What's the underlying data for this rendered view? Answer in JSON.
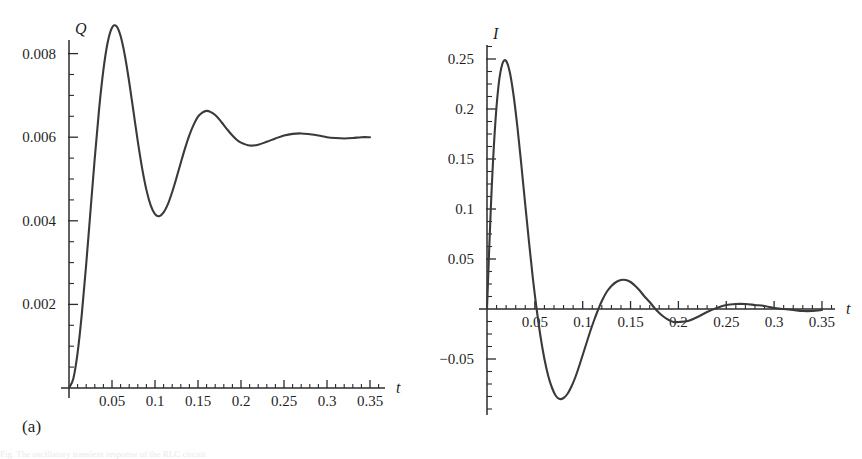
{
  "figure": {
    "panels": [
      {
        "caption": "(a)",
        "y_axis_name": "Q",
        "x_axis_name": "t"
      },
      {
        "caption": "(b)",
        "y_axis_name": "I",
        "x_axis_name": "t"
      }
    ],
    "cut_off_caption_line": "Fig. The oscillatory transient response of the RLC circuit"
  },
  "chart_data": [
    {
      "type": "line",
      "title": "",
      "subtitle": "",
      "panel_label": "(a)",
      "xlabel": "t",
      "ylabel": "Q",
      "xlim": [
        0,
        0.36
      ],
      "ylim": [
        0,
        0.0085
      ],
      "grid": false,
      "legend": "none",
      "xticks": [
        0.05,
        0.1,
        0.15,
        0.2,
        0.25,
        0.3,
        0.35
      ],
      "xtick_labels": [
        "0.05",
        "0.1",
        "0.15",
        "0.2",
        "0.25",
        "0.3",
        "0.35"
      ],
      "xtick_minor_step": 0.01,
      "yticks": [
        0.002,
        0.004,
        0.006,
        0.008
      ],
      "ytick_labels": [
        "0.002",
        "0.004",
        "0.006",
        "0.008"
      ],
      "ytick_minor_step": 0.0005,
      "annotations": [
        {
          "label": "first maximum",
          "x": 0.054,
          "y": 0.0081
        },
        {
          "label": "first minimum",
          "x": 0.107,
          "y": 0.00528
        },
        {
          "label": "second maximum",
          "x": 0.158,
          "y": 0.00625
        },
        {
          "label": "second minimum",
          "x": 0.209,
          "y": 0.00585
        },
        {
          "label": "steady state",
          "x": 0.35,
          "y": 0.006
        }
      ],
      "model": {
        "description": "Q(t) = Qf * (1 - exp(-alpha*t) * (cos(w*t) + (alpha/w)*sin(w*t)))",
        "Qf": 0.006,
        "alpha": 27.0,
        "w": 60.5
      },
      "series": [
        {
          "name": "Q(t)",
          "color": "#3a3a3a",
          "x": [
            0,
            0.005,
            0.01,
            0.015,
            0.02,
            0.025,
            0.03,
            0.035,
            0.04,
            0.045,
            0.05,
            0.055,
            0.06,
            0.065,
            0.07,
            0.075,
            0.08,
            0.085,
            0.09,
            0.095,
            0.1,
            0.105,
            0.11,
            0.115,
            0.12,
            0.125,
            0.13,
            0.135,
            0.14,
            0.145,
            0.15,
            0.155,
            0.16,
            0.165,
            0.17,
            0.175,
            0.18,
            0.185,
            0.19,
            0.195,
            0.2,
            0.21,
            0.22,
            0.23,
            0.24,
            0.25,
            0.26,
            0.27,
            0.28,
            0.29,
            0.3,
            0.31,
            0.32,
            0.33,
            0.34,
            0.35
          ],
          "y": [
            0.0,
            0.00022,
            0.00084,
            0.00179,
            0.00296,
            0.00424,
            0.00551,
            0.00667,
            0.00761,
            0.00827,
            0.00862,
            0.00866,
            0.00842,
            0.00795,
            0.00732,
            0.00661,
            0.0059,
            0.00526,
            0.00474,
            0.00437,
            0.00416,
            0.00411,
            0.0042,
            0.0044,
            0.00469,
            0.00503,
            0.00539,
            0.00574,
            0.00605,
            0.0063,
            0.00649,
            0.00659,
            0.00663,
            0.0066,
            0.00653,
            0.00642,
            0.00629,
            0.00616,
            0.00604,
            0.00594,
            0.00587,
            0.0058,
            0.00582,
            0.00589,
            0.00597,
            0.00604,
            0.00608,
            0.00609,
            0.00607,
            0.00604,
            0.006,
            0.00598,
            0.00597,
            0.00598,
            0.006,
            0.006
          ]
        }
      ]
    },
    {
      "type": "line",
      "title": "",
      "subtitle": "",
      "panel_label": "(b)",
      "xlabel": "t",
      "ylabel": "I",
      "xlim": [
        0,
        0.36
      ],
      "ylim": [
        -0.1,
        0.27
      ],
      "grid": false,
      "legend": "none",
      "xticks": [
        0.05,
        0.1,
        0.15,
        0.2,
        0.25,
        0.3,
        0.35
      ],
      "xtick_labels": [
        "0.05",
        "0.1",
        "0.15",
        "0.2",
        "0.25",
        "0.3",
        "0.35"
      ],
      "xtick_minor_step": 0.01,
      "yticks": [
        -0.05,
        0.05,
        0.1,
        0.15,
        0.2,
        0.25
      ],
      "ytick_labels": [
        "−0.05",
        "0.05",
        "0.1",
        "0.15",
        "0.2",
        "0.25"
      ],
      "ytick_minor_step": 0.0125,
      "annotations": [
        {
          "label": "peak current",
          "x": 0.023,
          "y": 0.248
        },
        {
          "label": "first zero crossing",
          "x": 0.052,
          "y": 0.0
        },
        {
          "label": "minimum current",
          "x": 0.076,
          "y": -0.09
        },
        {
          "label": "second zero crossing",
          "x": 0.104,
          "y": 0.0
        },
        {
          "label": "second peak",
          "x": 0.129,
          "y": 0.035
        },
        {
          "label": "third zero crossing",
          "x": 0.155,
          "y": 0.0
        },
        {
          "label": "second dip",
          "x": 0.181,
          "y": -0.013
        },
        {
          "label": "third peak",
          "x": 0.234,
          "y": 0.005
        }
      ],
      "model": {
        "description": "I(t) = dQ/dt = Qf * (alpha^2 + w^2)/w * exp(-alpha*t) * sin(w*t)",
        "Qf": 0.006,
        "alpha": 27.0,
        "w": 60.5
      },
      "series": [
        {
          "name": "I(t)",
          "color": "#3a3a3a",
          "x": [
            0,
            0.004,
            0.008,
            0.012,
            0.016,
            0.02,
            0.024,
            0.028,
            0.032,
            0.036,
            0.04,
            0.044,
            0.048,
            0.052,
            0.056,
            0.06,
            0.064,
            0.068,
            0.072,
            0.076,
            0.08,
            0.084,
            0.088,
            0.092,
            0.096,
            0.1,
            0.104,
            0.108,
            0.112,
            0.116,
            0.12,
            0.125,
            0.13,
            0.135,
            0.14,
            0.145,
            0.15,
            0.155,
            0.16,
            0.165,
            0.17,
            0.175,
            0.18,
            0.185,
            0.19,
            0.195,
            0.2,
            0.21,
            0.22,
            0.23,
            0.24,
            0.25,
            0.26,
            0.27,
            0.28,
            0.29,
            0.3,
            0.31,
            0.32,
            0.33,
            0.34,
            0.35
          ],
          "y": [
            0.0,
            0.101,
            0.176,
            0.223,
            0.245,
            0.248,
            0.236,
            0.212,
            0.18,
            0.143,
            0.104,
            0.066,
            0.03,
            -0.001,
            -0.028,
            -0.05,
            -0.067,
            -0.079,
            -0.087,
            -0.09,
            -0.089,
            -0.085,
            -0.078,
            -0.069,
            -0.058,
            -0.046,
            -0.034,
            -0.022,
            -0.011,
            -0.001,
            0.008,
            0.017,
            0.023,
            0.027,
            0.029,
            0.029,
            0.027,
            0.023,
            0.018,
            0.012,
            0.007,
            0.001,
            -0.004,
            -0.008,
            -0.011,
            -0.013,
            -0.013,
            -0.012,
            -0.008,
            -0.003,
            0.001,
            0.004,
            0.005,
            0.005,
            0.004,
            0.003,
            0.001,
            0.0,
            -0.001,
            -0.002,
            -0.002,
            -0.001
          ]
        }
      ]
    }
  ]
}
